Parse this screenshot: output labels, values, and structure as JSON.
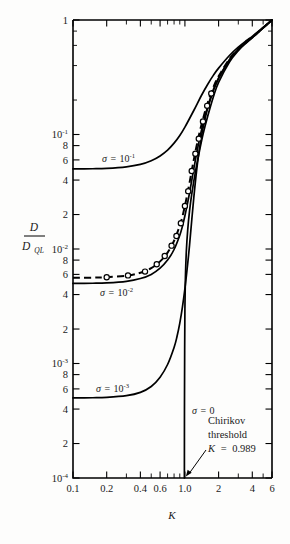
{
  "figure": {
    "name": "diffusion-ratio-vs-stochasticity-parameter",
    "background_color": "#fdfdfc",
    "ink_color": "#000000"
  },
  "chart_data": {
    "type": "line",
    "title": "",
    "subtitle": "",
    "xlabel": "K",
    "ylabel": "D / D_QL",
    "ylabel_numerator": "D",
    "ylabel_denominator": "D",
    "ylabel_denominator_sub": "QL",
    "xscale": "log",
    "yscale": "log",
    "xlim": [
      0.1,
      6
    ],
    "ylim": [
      0.0001,
      1
    ],
    "grid": false,
    "legend_position": "inline-curve-labels",
    "xticks": [
      {
        "value": 0.1,
        "label": "0.1",
        "major": true
      },
      {
        "value": 0.2,
        "label": "0.2",
        "major": true
      },
      {
        "value": 0.3,
        "label": "",
        "major": false
      },
      {
        "value": 0.4,
        "label": "0.4",
        "major": true
      },
      {
        "value": 0.5,
        "label": "",
        "major": false
      },
      {
        "value": 0.6,
        "label": "0.6",
        "major": true
      },
      {
        "value": 0.7,
        "label": "",
        "major": false
      },
      {
        "value": 0.8,
        "label": "",
        "major": false
      },
      {
        "value": 0.9,
        "label": "",
        "major": false
      },
      {
        "value": 1.0,
        "label": "1.0",
        "major": true
      },
      {
        "value": 2.0,
        "label": "2",
        "major": true
      },
      {
        "value": 3.0,
        "label": "",
        "major": false
      },
      {
        "value": 4.0,
        "label": "4",
        "major": true
      },
      {
        "value": 5.0,
        "label": "",
        "major": false
      },
      {
        "value": 6.0,
        "label": "6",
        "major": true
      }
    ],
    "yticks": [
      {
        "value": 1,
        "label": "1",
        "mantissa": "1",
        "exponent": "",
        "major": true
      },
      {
        "value": 0.8,
        "label": "",
        "major": false
      },
      {
        "value": 0.6,
        "label": "",
        "major": false
      },
      {
        "value": 0.4,
        "label": "",
        "major": false
      },
      {
        "value": 0.2,
        "label": "",
        "major": false
      },
      {
        "value": 0.1,
        "label": "10-1",
        "mantissa": "10",
        "exponent": "-1",
        "major": true
      },
      {
        "value": 0.08,
        "label": "8",
        "mantissa": "8",
        "exponent": "",
        "major": true
      },
      {
        "value": 0.06,
        "label": "6",
        "mantissa": "6",
        "exponent": "",
        "major": true
      },
      {
        "value": 0.04,
        "label": "4",
        "mantissa": "4",
        "exponent": "",
        "major": true
      },
      {
        "value": 0.02,
        "label": "2",
        "mantissa": "2",
        "exponent": "",
        "major": true
      },
      {
        "value": 0.01,
        "label": "10-2",
        "mantissa": "10",
        "exponent": "-2",
        "major": true
      },
      {
        "value": 0.008,
        "label": "8",
        "mantissa": "8",
        "exponent": "",
        "major": true
      },
      {
        "value": 0.006,
        "label": "6",
        "mantissa": "6",
        "exponent": "",
        "major": true
      },
      {
        "value": 0.004,
        "label": "4",
        "mantissa": "4",
        "exponent": "",
        "major": true
      },
      {
        "value": 0.002,
        "label": "2",
        "mantissa": "2",
        "exponent": "",
        "major": true
      },
      {
        "value": 0.001,
        "label": "10-3",
        "mantissa": "10",
        "exponent": "-3",
        "major": true
      },
      {
        "value": 0.0008,
        "label": "8",
        "mantissa": "8",
        "exponent": "",
        "major": true
      },
      {
        "value": 0.0006,
        "label": "6",
        "mantissa": "6",
        "exponent": "",
        "major": true
      },
      {
        "value": 0.0004,
        "label": "4",
        "mantissa": "4",
        "exponent": "",
        "major": true
      },
      {
        "value": 0.0002,
        "label": "2",
        "mantissa": "2",
        "exponent": "",
        "major": true
      },
      {
        "value": 0.0001,
        "label": "10-4",
        "mantissa": "10",
        "exponent": "-4",
        "major": true
      }
    ],
    "series": [
      {
        "name": "sigma = 1e-1",
        "label_sigma": "σ",
        "label_equals": "=",
        "label_mantissa": "10",
        "label_exponent": "-1",
        "style": "solid",
        "markers": false,
        "plateau_value": 0.05,
        "points": [
          [
            0.1,
            0.05
          ],
          [
            0.15,
            0.0502
          ],
          [
            0.2,
            0.0506
          ],
          [
            0.3,
            0.0522
          ],
          [
            0.4,
            0.0548
          ],
          [
            0.5,
            0.059
          ],
          [
            0.6,
            0.065
          ],
          [
            0.7,
            0.073
          ],
          [
            0.8,
            0.084
          ],
          [
            0.9,
            0.098
          ],
          [
            1.0,
            0.116
          ],
          [
            1.2,
            0.162
          ],
          [
            1.4,
            0.218
          ],
          [
            1.6,
            0.275
          ],
          [
            1.8,
            0.33
          ],
          [
            2.0,
            0.38
          ],
          [
            2.5,
            0.49
          ],
          [
            3.0,
            0.58
          ],
          [
            3.5,
            0.655
          ],
          [
            4.0,
            0.72
          ],
          [
            4.5,
            0.79
          ],
          [
            5.0,
            0.86
          ],
          [
            5.5,
            0.93
          ],
          [
            6.0,
            1.0
          ]
        ]
      },
      {
        "name": "sigma = 1e-2",
        "label_sigma": "σ",
        "label_equals": "=",
        "label_mantissa": "10",
        "label_exponent": "-2",
        "style": "solid",
        "markers": false,
        "plateau_value": 0.005,
        "points": [
          [
            0.1,
            0.005
          ],
          [
            0.15,
            0.00502
          ],
          [
            0.2,
            0.00506
          ],
          [
            0.3,
            0.00522
          ],
          [
            0.4,
            0.00552
          ],
          [
            0.5,
            0.006
          ],
          [
            0.6,
            0.0068
          ],
          [
            0.7,
            0.008
          ],
          [
            0.8,
            0.0099
          ],
          [
            0.9,
            0.0132
          ],
          [
            0.95,
            0.0158
          ],
          [
            1.0,
            0.0195
          ],
          [
            1.05,
            0.0245
          ],
          [
            1.1,
            0.031
          ],
          [
            1.2,
            0.05
          ],
          [
            1.3,
            0.076
          ],
          [
            1.4,
            0.107
          ],
          [
            1.5,
            0.141
          ],
          [
            1.6,
            0.176
          ],
          [
            1.8,
            0.248
          ],
          [
            2.0,
            0.312
          ],
          [
            2.5,
            0.45
          ],
          [
            3.0,
            0.552
          ],
          [
            3.5,
            0.635
          ],
          [
            4.0,
            0.705
          ],
          [
            4.5,
            0.78
          ],
          [
            5.0,
            0.855
          ],
          [
            5.5,
            0.928
          ],
          [
            6.0,
            1.0
          ]
        ]
      },
      {
        "name": "sigma = 1e-3",
        "label_sigma": "σ",
        "label_equals": "=",
        "label_mantissa": "10",
        "label_exponent": "-3",
        "style": "solid",
        "markers": false,
        "plateau_value": 0.0005,
        "points": [
          [
            0.1,
            0.0005
          ],
          [
            0.15,
            0.000502
          ],
          [
            0.2,
            0.000506
          ],
          [
            0.3,
            0.000524
          ],
          [
            0.4,
            0.00056
          ],
          [
            0.5,
            0.00063
          ],
          [
            0.6,
            0.00076
          ],
          [
            0.7,
            0.00098
          ],
          [
            0.8,
            0.00138
          ],
          [
            0.85,
            0.00172
          ],
          [
            0.9,
            0.00225
          ],
          [
            0.95,
            0.0031
          ],
          [
            1.0,
            0.0045
          ],
          [
            1.05,
            0.0069
          ],
          [
            1.1,
            0.0108
          ],
          [
            1.2,
            0.028
          ],
          [
            1.3,
            0.058
          ],
          [
            1.4,
            0.095
          ],
          [
            1.5,
            0.132
          ],
          [
            1.6,
            0.17
          ],
          [
            1.8,
            0.243
          ],
          [
            2.0,
            0.308
          ],
          [
            2.5,
            0.448
          ],
          [
            3.0,
            0.55
          ],
          [
            3.5,
            0.633
          ],
          [
            4.0,
            0.704
          ],
          [
            4.5,
            0.779
          ],
          [
            5.0,
            0.854
          ],
          [
            5.5,
            0.927
          ],
          [
            6.0,
            1.0
          ]
        ]
      },
      {
        "name": "sigma = 0",
        "label_sigma": "σ",
        "label_equals": "=",
        "label_mantissa": "0",
        "label_exponent": "",
        "style": "solid",
        "markers": false,
        "plateau_value": null,
        "points": [
          [
            0.989,
            0.0001
          ],
          [
            0.991,
            0.0004
          ],
          [
            0.995,
            0.0013
          ],
          [
            1.0,
            0.003
          ],
          [
            1.01,
            0.0056
          ],
          [
            1.03,
            0.0096
          ],
          [
            1.06,
            0.0148
          ],
          [
            1.1,
            0.0215
          ],
          [
            1.15,
            0.03
          ],
          [
            1.25,
            0.049
          ],
          [
            1.35,
            0.072
          ],
          [
            1.45,
            0.1
          ],
          [
            1.6,
            0.145
          ],
          [
            1.8,
            0.215
          ],
          [
            2.0,
            0.285
          ],
          [
            2.5,
            0.43
          ],
          [
            3.0,
            0.54
          ],
          [
            3.5,
            0.625
          ],
          [
            4.0,
            0.7
          ],
          [
            4.5,
            0.776
          ],
          [
            5.0,
            0.852
          ],
          [
            5.5,
            0.926
          ],
          [
            6.0,
            1.0
          ]
        ]
      },
      {
        "name": "theory-dashed",
        "label_sigma": "",
        "label_equals": "",
        "label_mantissa": "",
        "label_exponent": "",
        "style": "dashed",
        "markers": false,
        "plateau_value": 0.0056,
        "points": [
          [
            0.1,
            0.0056
          ],
          [
            0.15,
            0.00562
          ],
          [
            0.2,
            0.00567
          ],
          [
            0.3,
            0.00585
          ],
          [
            0.4,
            0.0062
          ],
          [
            0.5,
            0.0068
          ],
          [
            0.6,
            0.0078
          ],
          [
            0.7,
            0.0093
          ],
          [
            0.8,
            0.0118
          ],
          [
            0.9,
            0.016
          ],
          [
            0.95,
            0.0192
          ],
          [
            1.0,
            0.0238
          ],
          [
            1.05,
            0.03
          ],
          [
            1.1,
            0.038
          ],
          [
            1.2,
            0.06
          ],
          [
            1.3,
            0.088
          ],
          [
            1.4,
            0.12
          ],
          [
            1.5,
            0.154
          ],
          [
            1.6,
            0.19
          ],
          [
            1.8,
            0.26
          ],
          [
            2.0,
            0.322
          ],
          [
            2.5,
            0.458
          ],
          [
            3.0,
            0.558
          ],
          [
            3.5,
            0.64
          ],
          [
            4.0,
            0.71
          ],
          [
            4.5,
            0.783
          ],
          [
            5.0,
            0.857
          ],
          [
            5.5,
            0.929
          ],
          [
            6.0,
            1.0
          ]
        ]
      }
    ],
    "data_markers": {
      "name": "simulation-points",
      "shape": "open-circle",
      "points": [
        [
          0.2,
          0.00567
        ],
        [
          0.31,
          0.00588
        ],
        [
          0.44,
          0.00635
        ],
        [
          0.56,
          0.00735
        ],
        [
          0.66,
          0.0087
        ],
        [
          0.76,
          0.0107
        ],
        [
          0.84,
          0.013
        ],
        [
          0.92,
          0.0168
        ],
        [
          1.0,
          0.0238
        ],
        [
          1.07,
          0.032
        ],
        [
          1.15,
          0.048
        ],
        [
          1.24,
          0.068
        ],
        [
          1.33,
          0.092
        ],
        [
          1.45,
          0.13
        ],
        [
          1.58,
          0.178
        ],
        [
          1.72,
          0.228
        ]
      ]
    },
    "annotations": [
      {
        "name": "chirikov-threshold-annotation",
        "line1": "Chirikov",
        "line2": "threshold",
        "line3_var": "K",
        "line3_eq": "=",
        "line3_val": "0.989",
        "arrow_target_x": 0.989,
        "arrow_target_y": 0.0001
      }
    ]
  }
}
